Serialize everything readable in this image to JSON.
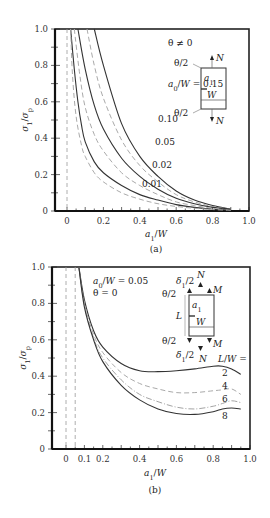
{
  "chart_data": [
    {
      "id": "a",
      "type": "line",
      "caption": "(a)",
      "xlabel": "a1/W",
      "ylabel": "σ1/σp",
      "xlim": [
        -0.05,
        1.0
      ],
      "ylim": [
        0,
        1.0
      ],
      "xticks": [
        "0",
        "0.2",
        "0.4",
        "0.6",
        "0.8",
        "1.0"
      ],
      "yticks": [
        "0",
        "0.2",
        "0.4",
        "0.6",
        "0.8",
        "1.0"
      ],
      "annotation": "θ ≠ 0",
      "legend_title": "a0/W = 0.15",
      "inset": {
        "labels": [
          "θ/2",
          "θ/2",
          "N",
          "N",
          "a1",
          "W"
        ]
      },
      "series": [
        {
          "name": "a0/W = 0.15",
          "label": "a0/W = 0.15",
          "style": "solid",
          "x": [
            0.15,
            0.2,
            0.3,
            0.4,
            0.5,
            0.6,
            0.7,
            0.8,
            0.9
          ],
          "y": [
            1.0,
            0.8,
            0.48,
            0.3,
            0.19,
            0.11,
            0.06,
            0.03,
            0.01
          ]
        },
        {
          "name": "a0/W = 0.10 (dashed)",
          "label": "",
          "style": "dash",
          "x": [
            0.11,
            0.15,
            0.2,
            0.3,
            0.4,
            0.5,
            0.6,
            0.7,
            0.8,
            0.9
          ],
          "y": [
            1.0,
            0.8,
            0.62,
            0.39,
            0.25,
            0.16,
            0.09,
            0.05,
            0.025,
            0.01
          ]
        },
        {
          "name": "a0/W = 0.10",
          "label": "0.10",
          "style": "solid",
          "x": [
            0.06,
            0.1,
            0.15,
            0.2,
            0.3,
            0.4,
            0.5,
            0.6,
            0.7,
            0.8,
            0.9
          ],
          "y": [
            1.0,
            0.78,
            0.58,
            0.45,
            0.29,
            0.19,
            0.12,
            0.07,
            0.04,
            0.02,
            0.01
          ]
        },
        {
          "name": "a0/W = 0.05",
          "label": "0.05",
          "style": "dash",
          "x": [
            0.04,
            0.07,
            0.1,
            0.15,
            0.2,
            0.3,
            0.4,
            0.5,
            0.6,
            0.7,
            0.8,
            0.9
          ],
          "y": [
            1.0,
            0.75,
            0.57,
            0.42,
            0.33,
            0.21,
            0.14,
            0.09,
            0.05,
            0.03,
            0.015,
            0.005
          ]
        },
        {
          "name": "a0/W = 0.02",
          "label": "0.02",
          "style": "solid",
          "x": [
            0.02,
            0.04,
            0.06,
            0.08,
            0.1,
            0.15,
            0.2,
            0.3,
            0.4,
            0.5,
            0.6,
            0.7,
            0.8,
            0.9
          ],
          "y": [
            1.0,
            0.78,
            0.6,
            0.47,
            0.38,
            0.27,
            0.21,
            0.14,
            0.09,
            0.06,
            0.035,
            0.02,
            0.01,
            0.005
          ]
        },
        {
          "name": "a0/W = 0.01",
          "label": "0.01",
          "style": "dash",
          "x": [
            0.0,
            0.0,
            0.0
          ],
          "y": [
            1.0,
            0.5,
            0.0
          ]
        }
      ]
    },
    {
      "id": "b",
      "type": "line",
      "caption": "(b)",
      "xlabel": "a1/W",
      "ylabel": "σ1/σp",
      "xlim": [
        -0.08,
        1.0
      ],
      "ylim": [
        0,
        1.0
      ],
      "xticks": [
        "0",
        "0.1",
        "0.2",
        "0.4",
        "0.6",
        "0.8",
        "1.0"
      ],
      "yticks": [
        "0",
        "0.2",
        "0.4",
        "0.6",
        "0.8",
        "1.0"
      ],
      "annotation": [
        "a0/W = 0.05",
        "θ = 0"
      ],
      "legend_title": "L/W =",
      "inset": {
        "labels": [
          "δ1/2",
          "N",
          "M",
          "θ/2",
          "a1",
          "L",
          "W",
          "θ/2",
          "M",
          "δ1/2",
          "N"
        ]
      },
      "series": [
        {
          "name": "L/W = 2",
          "label": "2",
          "style": "solid",
          "x": [
            0.07,
            0.1,
            0.15,
            0.2,
            0.3,
            0.4,
            0.5,
            0.6,
            0.7,
            0.8,
            0.85,
            0.9,
            0.95
          ],
          "y": [
            1.0,
            0.82,
            0.65,
            0.56,
            0.47,
            0.43,
            0.425,
            0.43,
            0.44,
            0.455,
            0.455,
            0.44,
            0.41
          ]
        },
        {
          "name": "L/W = 4",
          "label": "4",
          "style": "dash",
          "x": [
            0.07,
            0.1,
            0.15,
            0.2,
            0.3,
            0.4,
            0.5,
            0.6,
            0.7,
            0.8,
            0.85,
            0.9,
            0.95
          ],
          "y": [
            1.0,
            0.8,
            0.63,
            0.53,
            0.42,
            0.36,
            0.33,
            0.31,
            0.31,
            0.32,
            0.325,
            0.33,
            0.3
          ]
        },
        {
          "name": "L/W = 6",
          "label": "6",
          "style": "dashdot",
          "x": [
            0.07,
            0.1,
            0.15,
            0.2,
            0.3,
            0.4,
            0.5,
            0.6,
            0.7,
            0.8,
            0.85,
            0.9,
            0.95
          ],
          "y": [
            1.0,
            0.79,
            0.61,
            0.5,
            0.38,
            0.3,
            0.26,
            0.23,
            0.22,
            0.235,
            0.25,
            0.265,
            0.255
          ]
        },
        {
          "name": "L/W = 8",
          "label": "8",
          "style": "solid",
          "x": [
            0.07,
            0.1,
            0.15,
            0.2,
            0.3,
            0.4,
            0.5,
            0.6,
            0.7,
            0.8,
            0.85,
            0.9,
            0.95
          ],
          "y": [
            1.0,
            0.78,
            0.6,
            0.48,
            0.35,
            0.27,
            0.22,
            0.195,
            0.19,
            0.205,
            0.22,
            0.225,
            0.22
          ]
        }
      ]
    }
  ]
}
